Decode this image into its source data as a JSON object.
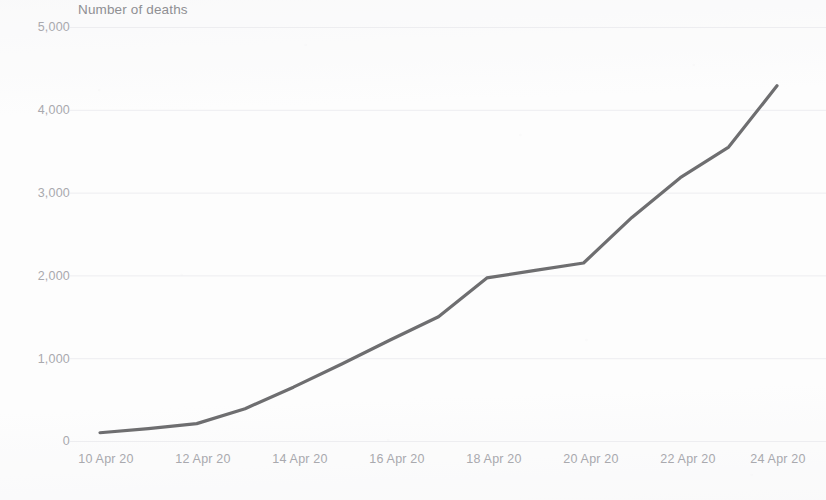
{
  "chart_data": {
    "type": "line",
    "title": "Number of deaths",
    "xlabel": "",
    "ylabel": "",
    "ylim": [
      0,
      5000
    ],
    "grid": true,
    "legend": "none",
    "line_color": "#6e6e70",
    "axis_text_color": "#a9a9ae",
    "title_color": "#8f8f93",
    "x_tick_labels": [
      "10 Apr 20",
      "12 Apr 20",
      "14 Apr 20",
      "16 Apr 20",
      "18 Apr 20",
      "20 Apr 20",
      "22 Apr 20",
      "24 Apr 20"
    ],
    "y_tick_labels": [
      "0",
      "1,000",
      "2,000",
      "3,000",
      "4,000",
      "5,000"
    ],
    "y_tick_values": [
      0,
      1000,
      2000,
      3000,
      4000,
      5000
    ],
    "categories": [
      "10 Apr 20",
      "11 Apr 20",
      "12 Apr 20",
      "13 Apr 20",
      "14 Apr 20",
      "15 Apr 20",
      "16 Apr 20",
      "17 Apr 20",
      "18 Apr 20",
      "19 Apr 20",
      "20 Apr 20",
      "21 Apr 20",
      "22 Apr 20",
      "23 Apr 20",
      "24 Apr 20"
    ],
    "series": [
      {
        "name": "Number of deaths",
        "values": [
          100,
          150,
          210,
          390,
          650,
          930,
          1220,
          1500,
          1970,
          2060,
          2150,
          2700,
          3180,
          3550,
          4290
        ]
      }
    ]
  }
}
